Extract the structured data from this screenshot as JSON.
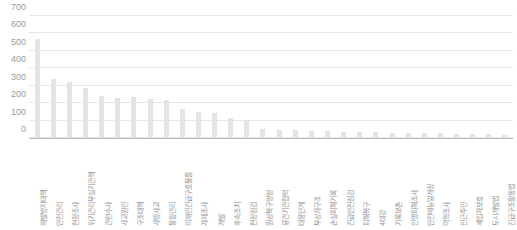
{
  "chart_data": {
    "type": "bar",
    "title": "",
    "subtitle": "",
    "xlabel": "",
    "ylabel": "",
    "ylim": [
      0,
      700
    ],
    "ytick_values": [
      0,
      100,
      200,
      300,
      400,
      500,
      600,
      700
    ],
    "ytick_labels": [
      "0",
      "100",
      "200",
      "300",
      "400",
      "500",
      "600",
      "700"
    ],
    "grid": true,
    "legend": "none",
    "bar_color": "#e4e4e4",
    "gridline_color": "#e6e6e6",
    "axis_color": "#b9b9b9",
    "tick_text_color": "#9a9a9a",
    "category_text_color": "#8e8e8e",
    "categories": [
      "재발방지대책",
      "안전관리",
      "현장조사",
      "위기관리부실기관책",
      "관련수사",
      "사고원인",
      "구조대책",
      "사망사고",
      "통합관리",
      "이재민긴급구호물품",
      "자체조사",
      "개발",
      "후속조치",
      "현장점검",
      "원상복구명령",
      "유관기관협력",
      "대응단계",
      "부상자구조",
      "손실피해기록",
      "긴급안전점검",
      "피해복구",
      "4대강",
      "기록보존",
      "인명피해조사",
      "안전매뉴얼개정",
      "역학조사",
      "인근주민",
      "세입자보호",
      "도시개발법",
      "긴급구조활동법"
    ],
    "values": [
      568,
      336,
      322,
      286,
      240,
      232,
      233,
      224,
      220,
      169,
      147,
      142,
      112,
      106,
      52,
      48,
      44,
      41,
      39,
      37,
      35,
      33,
      31,
      30,
      28,
      26,
      25,
      23,
      22,
      20
    ]
  }
}
